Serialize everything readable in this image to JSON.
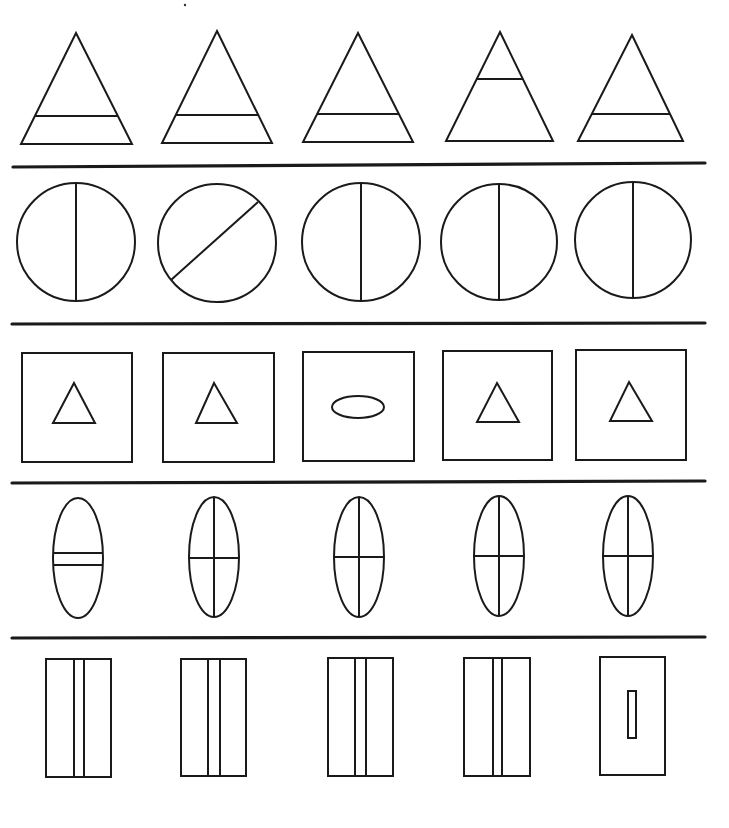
{
  "colors": {
    "ink": "#1a1a1a",
    "background": "#ffffff"
  },
  "rows": [
    {
      "name": "triangles",
      "description": "Triangles with a horizontal crossbar",
      "odd_index": 3,
      "items": [
        {
          "shape": "triangle",
          "apex": [
            76,
            33
          ],
          "base_y": 144,
          "base_x": [
            21,
            132
          ],
          "bar_y": 116
        },
        {
          "shape": "triangle",
          "apex": [
            217,
            31
          ],
          "base_y": 143,
          "base_x": [
            162,
            272
          ],
          "bar_y": 115
        },
        {
          "shape": "triangle",
          "apex": [
            358,
            33
          ],
          "base_y": 142,
          "base_x": [
            303,
            413
          ],
          "bar_y": 114
        },
        {
          "shape": "triangle",
          "apex": [
            500,
            32
          ],
          "base_y": 141,
          "base_x": [
            446,
            553
          ],
          "bar_y": 79
        },
        {
          "shape": "triangle",
          "apex": [
            632,
            35
          ],
          "base_y": 141,
          "base_x": [
            578,
            683
          ],
          "bar_y": 114
        }
      ]
    },
    {
      "name": "circles",
      "description": "Circles divided by a line",
      "odd_index": 1,
      "items": [
        {
          "shape": "circle",
          "cx": 76,
          "cy": 242,
          "r": 59,
          "divider": "vertical"
        },
        {
          "shape": "circle",
          "cx": 217,
          "cy": 243,
          "r": 59,
          "divider": "diagonal",
          "line": [
            171,
            280,
            258,
            202
          ]
        },
        {
          "shape": "circle",
          "cx": 361,
          "cy": 242,
          "r": 59,
          "divider": "vertical"
        },
        {
          "shape": "circle",
          "cx": 499,
          "cy": 242,
          "r": 58,
          "divider": "vertical"
        },
        {
          "shape": "circle",
          "cx": 633,
          "cy": 240,
          "r": 58,
          "divider": "vertical"
        }
      ]
    },
    {
      "name": "squares",
      "description": "Squares containing an inner shape",
      "odd_index": 2,
      "items": [
        {
          "shape": "square",
          "x": 22,
          "y": 353,
          "w": 110,
          "h": 109,
          "inner": "triangle",
          "apex": [
            74,
            383
          ],
          "base_y": 423,
          "base_x": [
            53,
            95
          ]
        },
        {
          "shape": "square",
          "x": 163,
          "y": 353,
          "w": 111,
          "h": 109,
          "inner": "triangle",
          "apex": [
            214,
            383
          ],
          "base_y": 423,
          "base_x": [
            196,
            237
          ]
        },
        {
          "shape": "square",
          "x": 303,
          "y": 352,
          "w": 111,
          "h": 109,
          "inner": "ellipse",
          "cx": 358,
          "cy": 407,
          "rx": 26,
          "ry": 11
        },
        {
          "shape": "square",
          "x": 443,
          "y": 351,
          "w": 109,
          "h": 109,
          "inner": "triangle",
          "apex": [
            497,
            383
          ],
          "base_y": 422,
          "base_x": [
            477,
            519
          ]
        },
        {
          "shape": "square",
          "x": 576,
          "y": 350,
          "w": 110,
          "h": 110,
          "inner": "triangle",
          "apex": [
            629,
            382
          ],
          "base_y": 421,
          "base_x": [
            610,
            652
          ]
        }
      ]
    },
    {
      "name": "ellipses",
      "description": "Vertical ellipses with internal lines",
      "odd_index": 0,
      "items": [
        {
          "shape": "ellipse",
          "cx": 78,
          "cy": 558,
          "rx": 25,
          "ry": 60,
          "inner": "double-bar",
          "bars_y": [
            553,
            565
          ]
        },
        {
          "shape": "ellipse",
          "cx": 214,
          "cy": 557,
          "rx": 25,
          "ry": 60,
          "inner": "cross",
          "cross_y": 558
        },
        {
          "shape": "ellipse",
          "cx": 359,
          "cy": 557,
          "rx": 25,
          "ry": 60,
          "inner": "cross",
          "cross_y": 557
        },
        {
          "shape": "ellipse",
          "cx": 499,
          "cy": 556,
          "rx": 25,
          "ry": 60,
          "inner": "cross",
          "cross_y": 556
        },
        {
          "shape": "ellipse",
          "cx": 628,
          "cy": 556,
          "rx": 25,
          "ry": 60,
          "inner": "cross",
          "cross_y": 556
        }
      ]
    },
    {
      "name": "rectangles",
      "description": "Tall rectangles with inner stripes",
      "odd_index": 4,
      "items": [
        {
          "shape": "rect",
          "x": 46,
          "y": 659,
          "w": 65,
          "h": 118,
          "inner": "stripe",
          "lines_x": [
            74,
            84
          ]
        },
        {
          "shape": "rect",
          "x": 181,
          "y": 659,
          "w": 65,
          "h": 117,
          "inner": "stripe",
          "lines_x": [
            208,
            220
          ]
        },
        {
          "shape": "rect",
          "x": 328,
          "y": 658,
          "w": 65,
          "h": 118,
          "inner": "stripe",
          "lines_x": [
            355,
            366
          ]
        },
        {
          "shape": "rect",
          "x": 464,
          "y": 658,
          "w": 66,
          "h": 118,
          "inner": "stripe",
          "lines_x": [
            493,
            502
          ]
        },
        {
          "shape": "rect",
          "x": 600,
          "y": 657,
          "w": 65,
          "h": 118,
          "inner": "small-rect",
          "sx": 628,
          "sy": 691,
          "sw": 8,
          "sh": 47
        }
      ]
    }
  ],
  "separators": [
    {
      "x1": 13,
      "y1": 167,
      "x2": 705,
      "y2": 163
    },
    {
      "x1": 12,
      "y1": 324,
      "x2": 705,
      "y2": 323
    },
    {
      "x1": 12,
      "y1": 483,
      "x2": 705,
      "y2": 481
    },
    {
      "x1": 12,
      "y1": 638,
      "x2": 705,
      "y2": 637
    }
  ],
  "speck": {
    "x": 185,
    "y": 5
  }
}
